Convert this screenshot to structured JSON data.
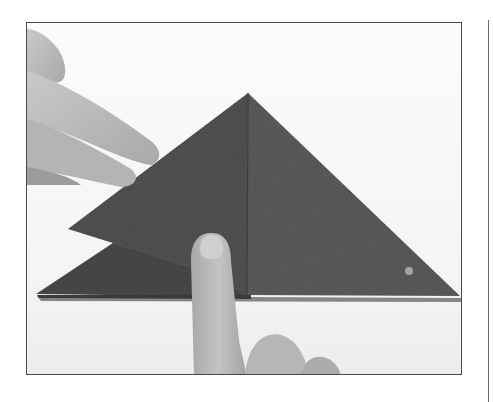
{
  "image": {
    "description": "Grayscale instructional photograph of hands folding a textured dark paper square into an origami triangle; an index finger presses the center fold while another hand holds the left flap.",
    "colors": {
      "background": "#ffffff",
      "frame_border": "#4a4a4a",
      "paper_dark": "#4f4f4f",
      "paper_mid": "#5e5e5e",
      "skin": "#bdbdbd",
      "rule": "#6a6a6a"
    }
  }
}
